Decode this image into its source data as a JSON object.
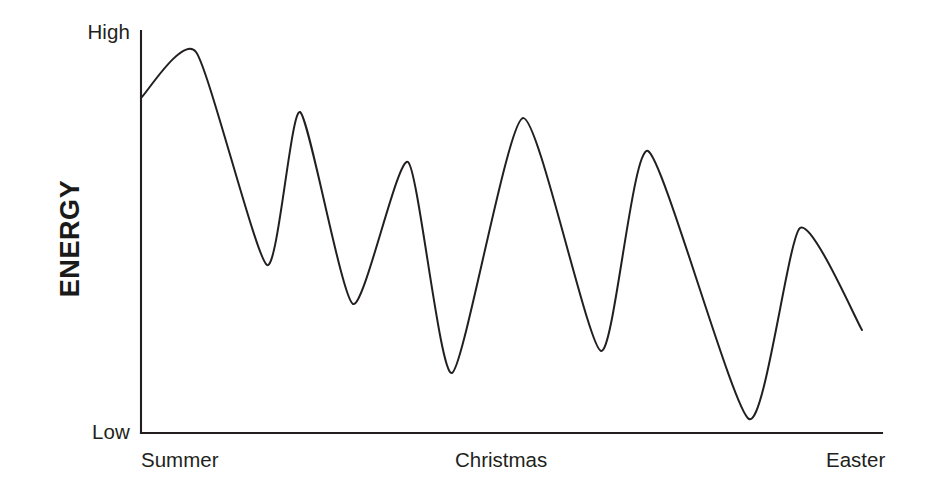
{
  "chart_data": {
    "type": "line",
    "title": "",
    "xlabel": "",
    "ylabel": "ENERGY",
    "grid": false,
    "legend": "none",
    "xlim": [
      0,
      1
    ],
    "ylim": [
      0,
      1
    ],
    "x_tick_labels": [
      "Summer",
      "Christmas",
      "Easter"
    ],
    "y_tick_labels": [
      "Low",
      "High"
    ],
    "y_axis_range_note": "Low to High (qualitative, unlabeled units)",
    "series": [
      {
        "name": "Energy over the academic year",
        "description": "Damped oscillating curve: energy starts high in Summer, swings between peaks and troughs with declining amplitude and lower troughs toward Easter.",
        "points": [
          {
            "label": "start",
            "x": 0.0,
            "y": 0.833,
            "px": 141,
            "py": 98
          },
          {
            "label": "peak-1",
            "x": 0.074,
            "y": 0.948,
            "px": 196,
            "py": 52
          },
          {
            "label": "trough-1",
            "x": 0.17,
            "y": 0.418,
            "px": 267,
            "py": 265
          },
          {
            "label": "peak-2",
            "x": 0.215,
            "y": 0.799,
            "px": 300,
            "py": 112
          },
          {
            "label": "trough-2",
            "x": 0.286,
            "y": 0.321,
            "px": 353,
            "py": 304
          },
          {
            "label": "peak-3",
            "x": 0.36,
            "y": 0.674,
            "px": 408,
            "py": 162
          },
          {
            "label": "trough-3",
            "x": 0.42,
            "y": 0.149,
            "px": 452,
            "py": 373
          },
          {
            "label": "peak-4",
            "x": 0.516,
            "y": 0.784,
            "px": 523,
            "py": 118
          },
          {
            "label": "trough-4",
            "x": 0.621,
            "y": 0.204,
            "px": 601,
            "py": 351
          },
          {
            "label": "peak-5",
            "x": 0.684,
            "y": 0.702,
            "px": 648,
            "py": 151
          },
          {
            "label": "trough-5",
            "x": 0.821,
            "y": 0.035,
            "px": 749,
            "py": 419
          },
          {
            "label": "peak-6",
            "x": 0.889,
            "y": 0.51,
            "px": 800,
            "py": 228
          },
          {
            "label": "end",
            "x": 0.973,
            "y": 0.256,
            "px": 862,
            "py": 330
          }
        ]
      }
    ]
  },
  "axes": {
    "y_high_label": "High",
    "y_low_label": "Low",
    "y_title": "ENERGY",
    "x_labels": {
      "start": "Summer",
      "middle": "Christmas",
      "end": "Easter"
    }
  },
  "style": {
    "line_color": "#231f20",
    "axis_color": "#231f20",
    "background": "#ffffff",
    "label_color": "#231f20"
  }
}
